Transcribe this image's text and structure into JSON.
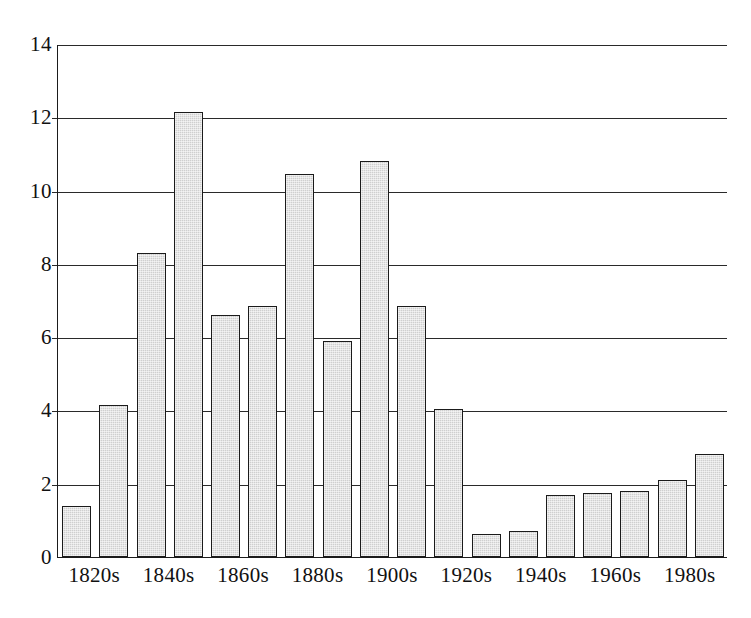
{
  "chart_data": {
    "type": "bar",
    "title": "",
    "subtitle": "",
    "xlabel": "",
    "ylabel": "",
    "categories": [
      "1820s",
      "1830s",
      "1840s",
      "1850s",
      "1860s",
      "1870s",
      "1880s",
      "1890s",
      "1900s",
      "1910s",
      "1920s",
      "1930s",
      "1940s",
      "1950s",
      "1960s",
      "1970s",
      "1980s",
      "1990s"
    ],
    "values": [
      1.4,
      4.15,
      8.3,
      12.15,
      6.6,
      6.85,
      10.45,
      5.9,
      10.8,
      6.85,
      4.05,
      0.62,
      0.72,
      1.7,
      1.75,
      1.8,
      2.1,
      2.8
    ],
    "ylim": [
      0,
      14
    ],
    "yticks": [
      "0",
      "2",
      "4",
      "6",
      "8",
      "10",
      "12",
      "14"
    ],
    "ytick_values": [
      0,
      2,
      4,
      6,
      8,
      10,
      12,
      14
    ],
    "visible_xtick_labels": [
      "1820s",
      "1840s",
      "1860s",
      "1880s",
      "1900s",
      "1920s",
      "1940s",
      "1960s",
      "1980s"
    ],
    "visible_xtick_indices": [
      0,
      2,
      4,
      6,
      8,
      10,
      12,
      14,
      16
    ],
    "grid": "horizontal",
    "legend": "none",
    "bar_fill_color": "#cfcfcf",
    "bar_edge_color": "#1b1b1b",
    "axis_color": "#2a2a2a",
    "background_color": "#ffffff"
  }
}
